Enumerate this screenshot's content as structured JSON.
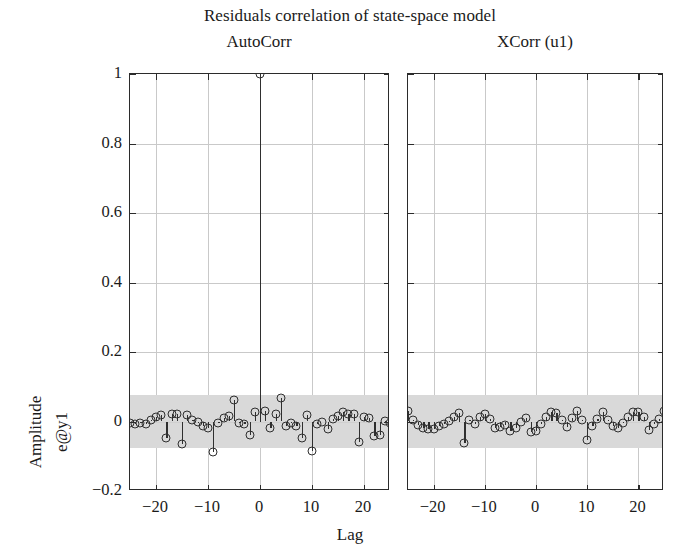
{
  "figure": {
    "title": "Residuals correlation of state-space model",
    "xlabel": "Lag",
    "ylabel_line1": "Amplitude",
    "ylabel_line2": "e@y1"
  },
  "chart_data": {
    "type": "line",
    "plot_style": "stem",
    "title": "Residuals correlation of state-space model",
    "xlabel": "Lag",
    "ylabel": "Amplitude e@y1",
    "grid": true,
    "legend": "none",
    "xlim": [
      -25,
      25
    ],
    "ylim": [
      -0.2,
      1.0
    ],
    "xticks": [
      -20,
      -10,
      0,
      10,
      20
    ],
    "xticklabels": [
      "−20",
      "−10",
      "0",
      "10",
      "20"
    ],
    "yticks": [
      -0.2,
      0,
      0.2,
      0.4,
      0.6,
      0.8,
      1
    ],
    "yticklabels": [
      "−0.2",
      "0",
      "0.2",
      "0.4",
      "0.6",
      "0.8",
      "1"
    ],
    "confidence_band": {
      "upper": 0.075,
      "lower": -0.075,
      "color": "#d9d9d9"
    },
    "subplots": [
      {
        "title": "AutoCorr",
        "x": [
          -25,
          -24,
          -23,
          -22,
          -21,
          -20,
          -19,
          -18,
          -17,
          -16,
          -15,
          -14,
          -13,
          -12,
          -11,
          -10,
          -9,
          -8,
          -7,
          -6,
          -5,
          -4,
          -3,
          -2,
          -1,
          0,
          1,
          2,
          3,
          4,
          5,
          6,
          7,
          8,
          9,
          10,
          11,
          12,
          13,
          14,
          15,
          16,
          17,
          18,
          19,
          20,
          21,
          22,
          23,
          24,
          25
        ],
        "y": [
          -0.005,
          -0.008,
          -0.004,
          -0.006,
          0.004,
          0.012,
          0.018,
          -0.048,
          0.022,
          0.022,
          -0.065,
          0.02,
          0.005,
          -0.002,
          -0.013,
          -0.018,
          -0.088,
          -0.004,
          0.01,
          0.017,
          0.062,
          -0.004,
          -0.008,
          -0.04,
          0.028,
          1.0,
          0.03,
          -0.018,
          0.022,
          0.068,
          -0.014,
          -0.005,
          -0.012,
          -0.047,
          0.02,
          -0.085,
          -0.008,
          0.0,
          -0.022,
          0.008,
          0.015,
          0.026,
          0.022,
          0.021,
          -0.06,
          0.012,
          0.01,
          -0.042,
          -0.04,
          0.002,
          -0.004
        ]
      },
      {
        "title": "XCorr (u1)",
        "x": [
          -25,
          -24,
          -23,
          -22,
          -21,
          -20,
          -19,
          -18,
          -17,
          -16,
          -15,
          -14,
          -13,
          -12,
          -11,
          -10,
          -9,
          -8,
          -7,
          -6,
          -5,
          -4,
          -3,
          -2,
          -1,
          0,
          1,
          2,
          3,
          4,
          5,
          6,
          7,
          8,
          9,
          10,
          11,
          12,
          13,
          14,
          15,
          16,
          17,
          18,
          19,
          20,
          21,
          22,
          23,
          24,
          25
        ],
        "y": [
          0.03,
          0.004,
          -0.01,
          -0.02,
          -0.022,
          -0.021,
          -0.014,
          -0.006,
          0.002,
          0.012,
          0.025,
          -0.062,
          0.004,
          -0.008,
          0.014,
          0.022,
          0.008,
          -0.018,
          -0.016,
          -0.01,
          -0.026,
          -0.02,
          0.0,
          0.01,
          -0.03,
          -0.026,
          -0.008,
          0.012,
          0.026,
          0.024,
          0.004,
          -0.016,
          0.01,
          0.03,
          0.004,
          -0.054,
          -0.012,
          0.008,
          0.026,
          0.005,
          -0.012,
          -0.02,
          -0.004,
          0.014,
          0.028,
          0.026,
          0.012,
          -0.024,
          -0.006,
          0.008,
          0.03
        ]
      }
    ]
  }
}
